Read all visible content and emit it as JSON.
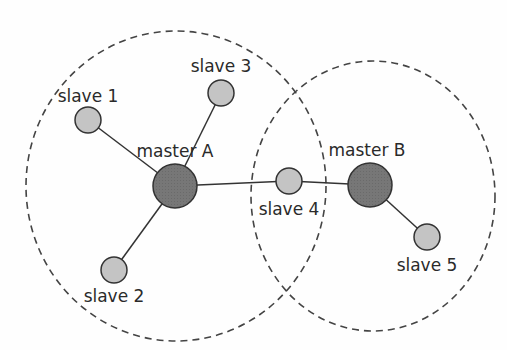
{
  "diagram": {
    "ranges": [
      {
        "id": "range-a",
        "cx": 176,
        "cy": 186,
        "rx": 150,
        "ry": 155
      },
      {
        "id": "range-b",
        "cx": 373,
        "cy": 196,
        "rx": 122,
        "ry": 135
      }
    ],
    "nodes": [
      {
        "id": "master-a",
        "label": "master A",
        "x": 175,
        "y": 186,
        "r": 22,
        "kind": "master",
        "lx": 175,
        "ly": 157
      },
      {
        "id": "master-b",
        "label": "master B",
        "x": 370,
        "y": 185,
        "r": 22,
        "kind": "master",
        "lx": 367,
        "ly": 156
      },
      {
        "id": "slave-1",
        "label": "slave 1",
        "x": 88,
        "y": 120,
        "r": 13,
        "kind": "slave",
        "lx": 88,
        "ly": 102
      },
      {
        "id": "slave-2",
        "label": "slave 2",
        "x": 114,
        "y": 270,
        "r": 13,
        "kind": "slave",
        "lx": 114,
        "ly": 302
      },
      {
        "id": "slave-3",
        "label": "slave 3",
        "x": 221,
        "y": 93,
        "r": 13,
        "kind": "slave",
        "lx": 221,
        "ly": 72
      },
      {
        "id": "slave-4",
        "label": "slave 4",
        "x": 289,
        "y": 181,
        "r": 13,
        "kind": "slave",
        "lx": 289,
        "ly": 215
      },
      {
        "id": "slave-5",
        "label": "slave 5",
        "x": 427,
        "y": 237,
        "r": 13,
        "kind": "slave",
        "lx": 427,
        "ly": 271
      }
    ],
    "links": [
      [
        "master-a",
        "slave-1"
      ],
      [
        "master-a",
        "slave-2"
      ],
      [
        "master-a",
        "slave-3"
      ],
      [
        "master-a",
        "slave-4"
      ],
      [
        "slave-4",
        "master-b"
      ],
      [
        "master-b",
        "slave-5"
      ]
    ],
    "colors": {
      "master_fill": "#7a7a7a",
      "slave_fill": "#c4c4c4",
      "stroke": "#333333",
      "dash": "#444444"
    }
  }
}
